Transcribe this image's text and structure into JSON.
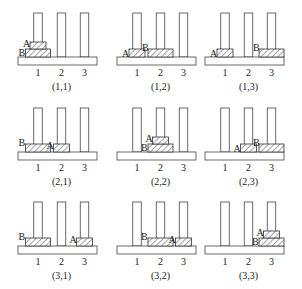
{
  "figure": {
    "peg_labels": [
      "1",
      "2",
      "3"
    ],
    "disk_labels": {
      "small": "A",
      "large": "B"
    },
    "panels": [
      {
        "caption": "(1,1)",
        "A_peg": 1,
        "B_peg": 1
      },
      {
        "caption": "(1,2)",
        "A_peg": 1,
        "B_peg": 2
      },
      {
        "caption": "(1,3)",
        "A_peg": 1,
        "B_peg": 3
      },
      {
        "caption": "(2,1)",
        "A_peg": 2,
        "B_peg": 1
      },
      {
        "caption": "(2,2)",
        "A_peg": 2,
        "B_peg": 2
      },
      {
        "caption": "(2,3)",
        "A_peg": 2,
        "B_peg": 3
      },
      {
        "caption": "(3,1)",
        "A_peg": 3,
        "B_peg": 1
      },
      {
        "caption": "(3,2)",
        "A_peg": 3,
        "B_peg": 2
      },
      {
        "caption": "(3,3)",
        "A_peg": 3,
        "B_peg": 3
      }
    ]
  }
}
